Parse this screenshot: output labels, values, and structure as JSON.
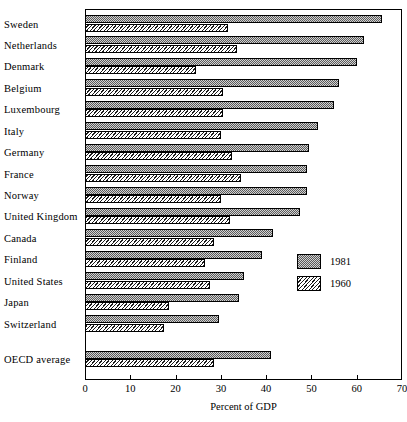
{
  "chart_data": {
    "type": "bar",
    "orientation": "horizontal",
    "title": "",
    "xlabel": "Percent of GDP",
    "ylabel": "",
    "xlim": [
      0,
      70
    ],
    "xticks": [
      0,
      10,
      20,
      30,
      40,
      50,
      60,
      70
    ],
    "grid": false,
    "legend_position": "middle-right",
    "categories": [
      "Sweden",
      "Netherlands",
      "Denmark",
      "Belgium",
      "Luxembourg",
      "Italy",
      "Germany",
      "France",
      "Norway",
      "United Kingdom",
      "Canada",
      "Finland",
      "United States",
      "Japan",
      "Switzerland",
      "OECD average"
    ],
    "series": [
      {
        "name": "1981",
        "fill": "stippled-gray",
        "values": [
          65.5,
          61.5,
          60.0,
          56.0,
          55.0,
          51.5,
          49.5,
          49.0,
          49.0,
          47.5,
          41.5,
          39.0,
          35.0,
          34.0,
          29.5,
          41.0
        ]
      },
      {
        "name": "1960",
        "fill": "diagonal-hatch",
        "values": [
          31.5,
          33.5,
          24.5,
          30.5,
          30.5,
          30.0,
          32.5,
          34.5,
          30.0,
          32.0,
          28.5,
          26.5,
          27.5,
          18.5,
          17.5,
          28.5
        ]
      }
    ]
  },
  "legend": {
    "items": [
      {
        "label": "1981",
        "fill": "stippled-gray"
      },
      {
        "label": "1960",
        "fill": "diagonal-hatch"
      }
    ]
  },
  "axis": {
    "x_title": "Percent of GDP",
    "tick_labels": [
      "0",
      "10",
      "20",
      "30",
      "40",
      "50",
      "60",
      "70"
    ]
  },
  "colors": {
    "bar_1981": "#d2d2d2",
    "bar_1960": "#e8e8e8",
    "outline": "#000000",
    "background": "#ffffff"
  }
}
